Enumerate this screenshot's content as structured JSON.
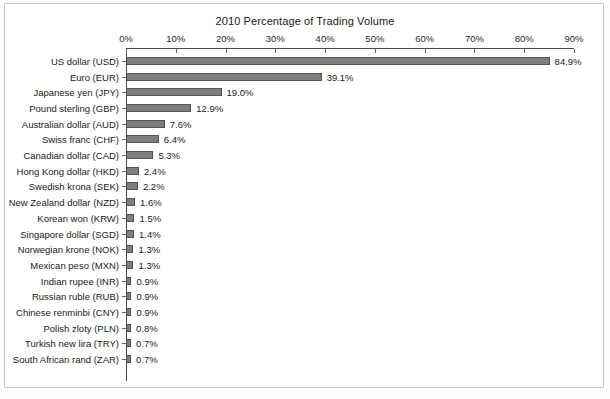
{
  "chart_data": {
    "type": "bar",
    "orientation": "horizontal",
    "title": "2010 Percentage of Trading Volume",
    "xlabel": "",
    "ylabel": "",
    "xlim": [
      0,
      90
    ],
    "xtick_labels": [
      "0%",
      "10%",
      "20%",
      "30%",
      "40%",
      "50%",
      "60%",
      "70%",
      "80%",
      "90%"
    ],
    "xtick_values": [
      0,
      10,
      20,
      30,
      40,
      50,
      60,
      70,
      80,
      90
    ],
    "grid": false,
    "legend": null,
    "bar_color": "#7d7d7d",
    "bar_edge_color": "#4d4d4d",
    "categories": [
      "US dollar (USD)",
      "Euro (EUR)",
      "Japanese yen (JPY)",
      "Pound sterling (GBP)",
      "Australian dollar (AUD)",
      "Swiss franc (CHF)",
      "Canadian dollar (CAD)",
      "Hong Kong dollar (HKD)",
      "Swedish krona (SEK)",
      "New Zealand dollar (NZD)",
      "Korean won (KRW)",
      "Singapore dollar (SGD)",
      "Norwegian krone (NOK)",
      "Mexican peso (MXN)",
      "Indian rupee (INR)",
      "Russian ruble (RUB)",
      "Chinese renminbi (CNY)",
      "Polish zloty (PLN)",
      "Turkish new lira (TRY)",
      "South African rand (ZAR)"
    ],
    "values": [
      84.9,
      39.1,
      19.0,
      12.9,
      7.6,
      6.4,
      5.3,
      2.4,
      2.2,
      1.6,
      1.5,
      1.4,
      1.3,
      1.3,
      0.9,
      0.9,
      0.9,
      0.8,
      0.7,
      0.7
    ],
    "value_labels": [
      "84.9%",
      "39.1%",
      "19.0%",
      "12.9%",
      "7.6%",
      "6.4%",
      "5.3%",
      "2.4%",
      "2.2%",
      "1.6%",
      "1.5%",
      "1.4%",
      "1.3%",
      "1.3%",
      "0.9%",
      "0.9%",
      "0.9%",
      "0.8%",
      "0.7%",
      "0.7%"
    ]
  }
}
